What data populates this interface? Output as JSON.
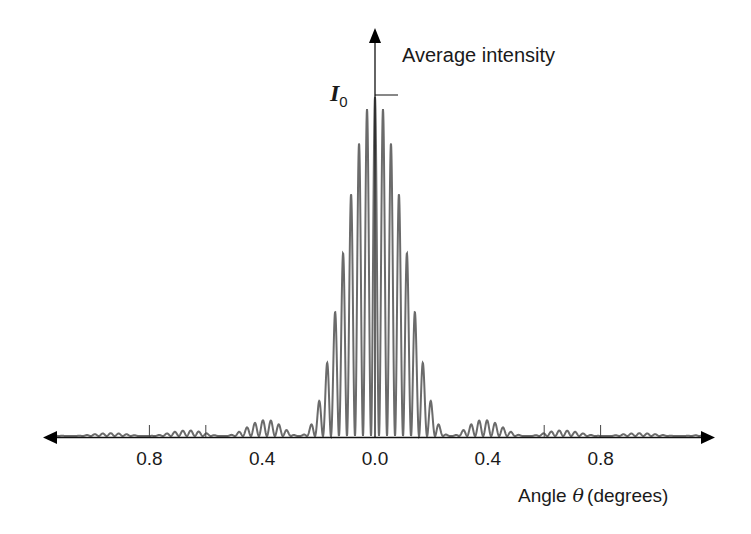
{
  "chart_data": {
    "type": "line",
    "title": "",
    "xlabel": "Angle θ (degrees)",
    "xlabel_parts": {
      "prefix": "Angle",
      "symbol": "θ",
      "suffix": "(degrees)"
    },
    "ylabel": "Average intensity",
    "peak_label": {
      "symbol": "I",
      "subscript": "0"
    },
    "x_tick_labels": [
      {
        "pos": -0.8,
        "text": "0.8"
      },
      {
        "pos": -0.4,
        "text": "0.4"
      },
      {
        "pos": 0.0,
        "text": "0.0"
      },
      {
        "pos": 0.4,
        "text": "0.4"
      },
      {
        "pos": 0.8,
        "text": "0.8"
      }
    ],
    "x_tick_marks": [
      -0.8,
      -0.6,
      0.6,
      0.8
    ],
    "xlim": [
      -1.17,
      1.17
    ],
    "ylim": [
      0,
      1.0
    ],
    "grid": false,
    "legend": null,
    "model": {
      "fringe_period_deg": 0.0284,
      "envelope_first_zero_deg": 0.27,
      "peak_intensity": 1.0
    },
    "envelope_peaks": [
      {
        "x": 0.0,
        "y": 1.0
      },
      {
        "x": -0.4,
        "y": 0.05
      },
      {
        "x": 0.4,
        "y": 0.05
      },
      {
        "x": -0.68,
        "y": 0.02
      },
      {
        "x": 0.68,
        "y": 0.02
      },
      {
        "x": -0.98,
        "y": 0.01
      },
      {
        "x": 0.98,
        "y": 0.01
      }
    ]
  },
  "colors": {
    "curve": "#6b6b6b",
    "axis": "#111111"
  }
}
